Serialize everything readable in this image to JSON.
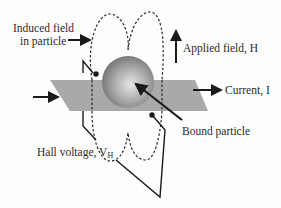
{
  "diagram": {
    "type": "hall-effect-sensor-schematic",
    "labels": {
      "induced_field_line1": "Induced field",
      "induced_field_line2": "in particle",
      "applied_field": "Applied field, H",
      "current": "Current, I",
      "bound_particle": "Bound particle",
      "hall_voltage": "Hall voltage, V",
      "hall_voltage_subscript": "H"
    },
    "elements": [
      {
        "name": "hall-plate",
        "shape": "parallelogram",
        "color": "#a9a9a9"
      },
      {
        "name": "magnetic-particle",
        "shape": "sphere",
        "color": "#9a9a9a"
      },
      {
        "name": "induced-field-lines",
        "style": "dashed"
      },
      {
        "name": "applied-field-arrow",
        "direction": "up"
      },
      {
        "name": "current-in-arrow",
        "direction": "right"
      },
      {
        "name": "current-out-arrow",
        "direction": "right"
      },
      {
        "name": "hall-voltage-leads",
        "count": 2
      }
    ],
    "colors": {
      "plate": "#a9a9a9",
      "sphere_highlight": "#e6e6e6",
      "sphere_shadow": "#6f6f6f",
      "line": "#1a1a1a",
      "text": "#2a2a2a"
    }
  }
}
